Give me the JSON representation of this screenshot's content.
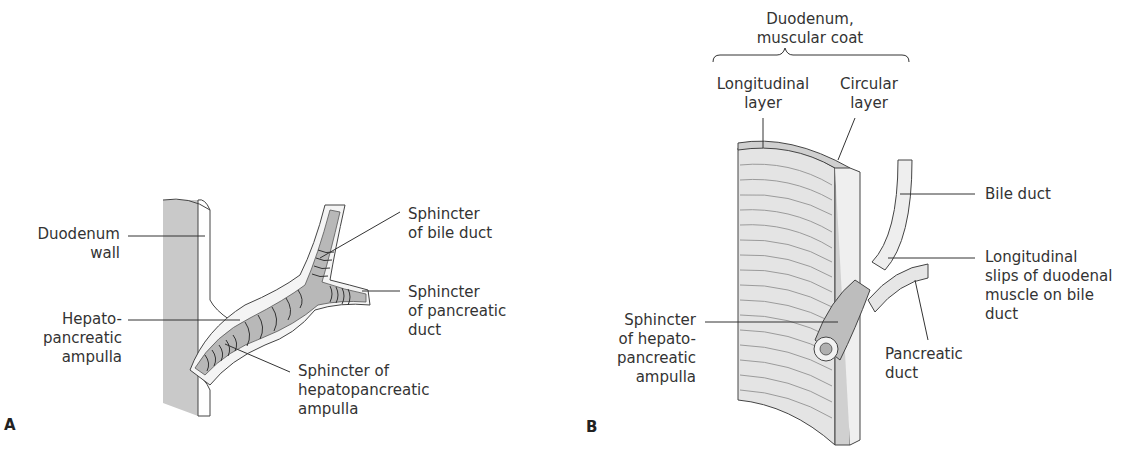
{
  "panel_a": {
    "letter": "A",
    "labels": {
      "duodenum_wall": "Duodenum\nwall",
      "hepatopancreatic_ampulla": "Hepato-\npancreatic\nampulla",
      "sphincter_bile_duct": "Sphincter\nof bile duct",
      "sphincter_pancreatic_duct": "Sphincter\nof pancreatic\nduct",
      "sphincter_hepatopancreatic_ampulla": "Sphincter of\nhepatopancreatic\nampulla"
    }
  },
  "panel_b": {
    "letter": "B",
    "labels": {
      "muscular_coat": "Duodenum,\nmuscular coat",
      "longitudinal_layer": "Longitudinal\nlayer",
      "circular_layer": "Circular\nlayer",
      "bile_duct": "Bile duct",
      "longitudinal_slips": "Longitudinal\nslips of duodenal\nmuscle on bile\nduct",
      "pancreatic_duct": "Pancreatic\nduct",
      "sphincter_hepatopancreatic_ampulla": "Sphincter\nof hepato-\npancreatic\nampulla"
    }
  },
  "colors": {
    "wall_gray": "#c9c9c9",
    "duct_gray": "#b8b8b8",
    "line": "#333333"
  }
}
